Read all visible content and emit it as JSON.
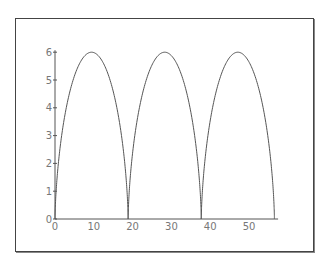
{
  "chart_data": {
    "type": "line",
    "title": "",
    "xlabel": "",
    "ylabel": "",
    "xlim": [
      0,
      57
    ],
    "ylim": [
      0,
      6
    ],
    "x_ticks": [
      0,
      10,
      20,
      30,
      40,
      50
    ],
    "y_ticks": [
      0,
      1,
      2,
      3,
      4,
      5,
      6
    ],
    "grid": false,
    "legend": null,
    "series": [
      {
        "name": "cycloid",
        "description": "Cycloid x = 3(t - sin t), y = 3(1 - cos t), t in [0, 6π]; three arches of height 6, cusps at x ≈ 0, 18.85, 37.7, 56.5",
        "x": [
          0,
          0.5,
          2.2,
          4.6,
          7.6,
          9.4,
          11.3,
          14.3,
          16.6,
          18.3,
          18.85,
          19.4,
          21.1,
          23.5,
          26.4,
          28.3,
          30.1,
          33.1,
          35.5,
          37.2,
          37.7,
          38.3,
          40.0,
          42.3,
          45.3,
          47.1,
          49.0,
          52.0,
          54.4,
          56.0,
          56.55
        ],
        "y": [
          0,
          1.3,
          3.0,
          4.5,
          5.6,
          6.0,
          5.8,
          4.5,
          3.0,
          1.3,
          0,
          1.3,
          3.0,
          4.5,
          5.8,
          6.0,
          5.8,
          4.5,
          3.0,
          1.3,
          0,
          1.3,
          3.0,
          4.5,
          5.8,
          6.0,
          5.8,
          4.5,
          3.0,
          1.3,
          0
        ]
      }
    ]
  }
}
